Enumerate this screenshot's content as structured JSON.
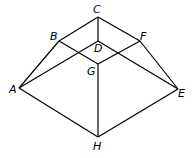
{
  "diagram": {
    "points": {
      "A": {
        "x": 19,
        "y": 88,
        "label": "A",
        "lx": 9,
        "ly": 93
      },
      "B": {
        "x": 59,
        "y": 41,
        "label": "B",
        "lx": 50,
        "ly": 40
      },
      "C": {
        "x": 98,
        "y": 17,
        "label": "C",
        "lx": 93,
        "ly": 13
      },
      "D": {
        "x": 98,
        "y": 41,
        "label": "D",
        "lx": 94,
        "ly": 52
      },
      "E": {
        "x": 178,
        "y": 89,
        "label": "E",
        "lx": 178,
        "ly": 97
      },
      "F": {
        "x": 140,
        "y": 41,
        "label": "F",
        "lx": 140,
        "ly": 40
      },
      "G": {
        "x": 98,
        "y": 64,
        "label": "G",
        "lx": 87,
        "ly": 75
      },
      "H": {
        "x": 98,
        "y": 137,
        "label": "H",
        "lx": 93,
        "ly": 150
      }
    },
    "edges": [
      [
        "C",
        "B"
      ],
      [
        "C",
        "F"
      ],
      [
        "C",
        "D"
      ],
      [
        "B",
        "A"
      ],
      [
        "F",
        "E"
      ],
      [
        "B",
        "G"
      ],
      [
        "D",
        "E"
      ],
      [
        "A",
        "D"
      ],
      [
        "G",
        "F"
      ],
      [
        "G",
        "H"
      ],
      [
        "A",
        "H"
      ],
      [
        "H",
        "E"
      ]
    ]
  }
}
